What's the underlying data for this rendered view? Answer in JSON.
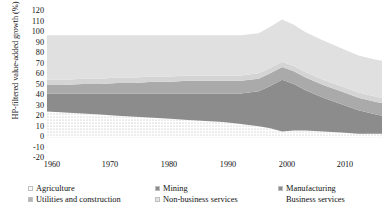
{
  "chart_data": {
    "type": "area",
    "stacked": true,
    "title": "",
    "xlabel": "",
    "ylabel": "HP-filtered value-added growth (%)",
    "ylim": [
      -20,
      120
    ],
    "xlim": [
      1960,
      2017
    ],
    "yticks": [
      -20,
      -10,
      0,
      10,
      20,
      30,
      40,
      50,
      60,
      70,
      80,
      90,
      100,
      110,
      120
    ],
    "xticks": [
      1960,
      1970,
      1980,
      1990,
      2000,
      2010
    ],
    "grid": false,
    "legend_position": "bottom",
    "x": [
      1960,
      1963,
      1966,
      1969,
      1972,
      1975,
      1978,
      1981,
      1984,
      1987,
      1990,
      1993,
      1996,
      1998,
      2000,
      2002,
      2004,
      2007,
      2010,
      2013,
      2016,
      2017
    ],
    "series": [
      {
        "name": "Agriculture",
        "color": "#f2f2f2",
        "pattern": "dotted",
        "values": [
          25,
          24,
          23,
          22,
          21,
          20,
          19,
          18,
          17,
          16,
          15,
          13,
          11,
          9,
          6,
          7,
          7,
          6,
          5,
          4,
          4,
          4
        ]
      },
      {
        "name": "Mining",
        "color": "#8c8c8c",
        "values": [
          17,
          18,
          19,
          20,
          21,
          22,
          23,
          24,
          25,
          26,
          27,
          29,
          33,
          40,
          49,
          44,
          38,
          32,
          27,
          22,
          18,
          17
        ]
      },
      {
        "name": "Manufacturing",
        "color": "#aaaaaa",
        "values": [
          8,
          8,
          9,
          9,
          10,
          10,
          11,
          11,
          12,
          12,
          12,
          12,
          12,
          12,
          12,
          12,
          12,
          12,
          12,
          12,
          12,
          12
        ]
      },
      {
        "name": "Utilities and construction",
        "color": "#d4d4d4",
        "values": [
          5,
          5,
          5,
          5,
          5,
          5,
          5,
          5,
          5,
          5,
          5,
          5,
          5,
          5,
          5,
          5,
          5,
          5,
          5,
          5,
          5,
          5
        ]
      },
      {
        "name": "Non-business services",
        "color": "#e0e0e0",
        "values": [
          42,
          42,
          41,
          41,
          40,
          40,
          39,
          39,
          38,
          38,
          38,
          38,
          38,
          39,
          40,
          39,
          38,
          37,
          36,
          35,
          35,
          35
        ]
      },
      {
        "name": "Business services",
        "color": "#c8c8c8",
        "values": [
          0,
          0,
          0,
          0,
          0,
          0,
          0,
          0,
          0,
          0,
          0,
          0,
          0,
          0,
          0,
          0,
          0,
          0,
          0,
          0,
          0,
          0
        ]
      }
    ],
    "totals": [
      97,
      97,
      97,
      97,
      97,
      97,
      97,
      97,
      97,
      97,
      97,
      97,
      99,
      105,
      112,
      107,
      100,
      92,
      85,
      78,
      74,
      73
    ]
  },
  "axes": {
    "y_title": "HP-filtered value-added growth (%)",
    "y_ticks": [
      "120",
      "110",
      "100",
      "90",
      "80",
      "70",
      "60",
      "50",
      "40",
      "30",
      "20",
      "10",
      "0",
      "-10",
      "-20"
    ],
    "x_ticks": [
      "1960",
      "1970",
      "1980",
      "1990",
      "2000",
      "2010"
    ]
  },
  "legend": {
    "items": [
      {
        "label": "Agriculture",
        "color": "#fafafa"
      },
      {
        "label": "Mining",
        "color": "#8c8c8c"
      },
      {
        "label": "Manufacturing",
        "color": "#8c8c8c"
      },
      {
        "label": "Utilities and construction",
        "color": "#b5b5b5"
      },
      {
        "label": "Non-business services",
        "color": "#e2e2e2"
      },
      {
        "label": "Business services",
        "color": "#ffffff"
      }
    ]
  }
}
